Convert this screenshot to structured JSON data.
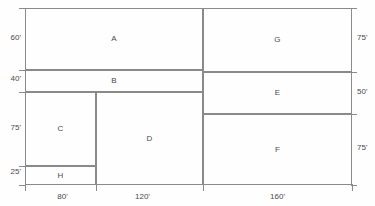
{
  "diagram": {
    "units": "feet",
    "stroke_color": "#8a8a8a",
    "text_color": "#4a4a4a",
    "background_color": "#fefefe"
  },
  "rooms": [
    {
      "label": "A",
      "x": 25,
      "y": 8,
      "w": 178,
      "h": 62
    },
    {
      "label": "B",
      "x": 25,
      "y": 70,
      "w": 178,
      "h": 22
    },
    {
      "label": "C",
      "x": 25,
      "y": 92,
      "w": 71,
      "h": 74
    },
    {
      "label": "H",
      "x": 25,
      "y": 166,
      "w": 71,
      "h": 19
    },
    {
      "label": "D",
      "x": 96,
      "y": 92,
      "w": 107,
      "h": 93
    },
    {
      "label": "G",
      "x": 203,
      "y": 8,
      "w": 149,
      "h": 64
    },
    {
      "label": "E",
      "x": 203,
      "y": 72,
      "w": 149,
      "h": 42
    },
    {
      "label": "F",
      "x": 203,
      "y": 114,
      "w": 149,
      "h": 71
    }
  ],
  "dimensions": {
    "left": [
      {
        "text": "60'",
        "y": 34
      },
      {
        "text": "40'",
        "y": 75
      },
      {
        "text": "75'",
        "y": 124
      },
      {
        "text": "25'",
        "y": 168
      }
    ],
    "right": [
      {
        "text": "75'",
        "y": 34
      },
      {
        "text": "50'",
        "y": 88
      },
      {
        "text": "75'",
        "y": 144
      }
    ],
    "bottom": [
      {
        "text": "80'",
        "x": 40,
        "w": 45
      },
      {
        "text": "120'",
        "x": 120,
        "w": 45
      },
      {
        "text": "160'",
        "x": 255,
        "w": 45
      }
    ]
  }
}
